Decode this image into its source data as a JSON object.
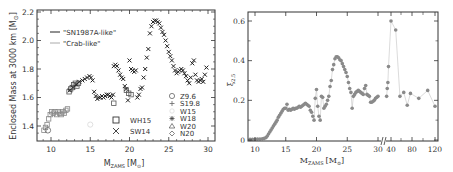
{
  "chart_data": [
    {
      "type": "scatter",
      "title": "",
      "xlabel": "M_ZAMS [M_sun]",
      "ylabel": "Enclosed Mass at 3000 km [M_sun]",
      "xlim": [
        8.3,
        31
      ],
      "ylim": [
        1.3,
        2.22
      ],
      "xticks": [
        10,
        15,
        20,
        25,
        30
      ],
      "yticks": [
        1.4,
        1.6,
        1.8,
        2.0,
        2.2
      ],
      "grid": false,
      "legend_lines": [
        {
          "label": "\"SN1987A-like\"",
          "color": "#222222"
        },
        {
          "label": "\"Crab-like\"",
          "color": "#aaaaaa"
        }
      ],
      "legend_series": [
        {
          "label": "WH15",
          "marker": "square"
        },
        {
          "label": "SW14",
          "marker": "x"
        }
      ],
      "legend_models": [
        {
          "label": "Z9.6",
          "marker": "circle"
        },
        {
          "label": "S19.8",
          "marker": "plus"
        },
        {
          "label": "W15",
          "marker": "light-circle"
        },
        {
          "label": "W18",
          "marker": "asterisk"
        },
        {
          "label": "W20",
          "marker": "triangle"
        },
        {
          "label": "N20",
          "marker": "diamond"
        }
      ],
      "series": [
        {
          "name": "WH15",
          "marker": "square",
          "points": [
            [
              9.1,
              1.37
            ],
            [
              9.3,
              1.39
            ],
            [
              9.5,
              1.41
            ],
            [
              9.7,
              1.45
            ],
            [
              9.9,
              1.48
            ],
            [
              10.1,
              1.5
            ],
            [
              10.3,
              1.49
            ],
            [
              10.5,
              1.5
            ],
            [
              10.7,
              1.48
            ],
            [
              10.9,
              1.5
            ],
            [
              11.1,
              1.49
            ],
            [
              11.3,
              1.48
            ],
            [
              11.5,
              1.5
            ],
            [
              11.7,
              1.49
            ],
            [
              11.9,
              1.51
            ],
            [
              12.1,
              1.52
            ],
            [
              12.3,
              1.64
            ],
            [
              12.5,
              1.66
            ],
            [
              12.7,
              1.67
            ],
            [
              12.9,
              1.69
            ],
            [
              13.1,
              1.7
            ],
            [
              13.3,
              1.68
            ],
            [
              13.5,
              1.7
            ],
            [
              18.0,
              1.56
            ],
            [
              19.6,
              1.65
            ],
            [
              19.9,
              1.63
            ],
            [
              20.2,
              1.62
            ]
          ]
        },
        {
          "name": "SW14",
          "marker": "x",
          "points": [
            [
              12.4,
              1.65
            ],
            [
              12.8,
              1.67
            ],
            [
              13.2,
              1.69
            ],
            [
              13.6,
              1.71
            ],
            [
              14.0,
              1.72
            ],
            [
              14.3,
              1.73
            ],
            [
              14.6,
              1.74
            ],
            [
              14.9,
              1.75
            ],
            [
              15.1,
              1.74
            ],
            [
              15.3,
              1.72
            ],
            [
              15.5,
              1.64
            ],
            [
              15.7,
              1.61
            ],
            [
              15.9,
              1.59
            ],
            [
              16.1,
              1.6
            ],
            [
              16.3,
              1.6
            ],
            [
              16.5,
              1.61
            ],
            [
              16.7,
              1.6
            ],
            [
              16.9,
              1.61
            ],
            [
              17.1,
              1.62
            ],
            [
              17.3,
              1.62
            ],
            [
              17.5,
              1.61
            ],
            [
              17.7,
              1.6
            ],
            [
              17.9,
              1.62
            ],
            [
              18.0,
              1.82
            ],
            [
              18.2,
              1.83
            ],
            [
              18.4,
              1.82
            ],
            [
              18.6,
              1.79
            ],
            [
              18.8,
              1.76
            ],
            [
              19.0,
              1.74
            ],
            [
              19.2,
              1.73
            ],
            [
              19.4,
              1.68
            ],
            [
              19.6,
              1.66
            ],
            [
              19.8,
              1.58
            ],
            [
              20.0,
              1.86
            ],
            [
              20.2,
              1.8
            ],
            [
              20.4,
              1.79
            ],
            [
              20.6,
              1.78
            ],
            [
              20.8,
              1.79
            ],
            [
              21.0,
              1.6
            ],
            [
              21.2,
              1.62
            ],
            [
              21.4,
              1.66
            ],
            [
              21.6,
              1.67
            ],
            [
              21.8,
              1.74
            ],
            [
              22.0,
              1.8
            ],
            [
              22.2,
              1.88
            ],
            [
              22.4,
              1.94
            ],
            [
              22.6,
              2.05
            ],
            [
              22.8,
              2.1
            ],
            [
              23.0,
              2.13
            ],
            [
              23.2,
              2.14
            ],
            [
              23.4,
              2.14
            ],
            [
              23.6,
              2.13
            ],
            [
              23.8,
              2.12
            ],
            [
              24.0,
              2.09
            ],
            [
              24.2,
              2.06
            ],
            [
              24.4,
              2.04
            ],
            [
              24.6,
              2.0
            ],
            [
              24.8,
              1.96
            ],
            [
              25.0,
              1.92
            ],
            [
              25.2,
              1.89
            ],
            [
              25.4,
              1.86
            ],
            [
              25.6,
              1.82
            ],
            [
              25.8,
              1.79
            ],
            [
              26.0,
              1.77
            ],
            [
              26.2,
              1.78
            ],
            [
              26.4,
              1.79
            ],
            [
              26.6,
              1.8
            ],
            [
              26.8,
              1.79
            ],
            [
              27.0,
              1.77
            ],
            [
              27.2,
              1.75
            ],
            [
              27.4,
              1.72
            ],
            [
              27.6,
              1.7
            ],
            [
              27.8,
              1.74
            ],
            [
              28.0,
              1.84
            ],
            [
              28.2,
              1.86
            ],
            [
              28.4,
              1.76
            ],
            [
              28.6,
              1.72
            ],
            [
              28.8,
              1.71
            ],
            [
              29.0,
              1.72
            ],
            [
              29.2,
              1.73
            ],
            [
              29.4,
              1.71
            ],
            [
              29.6,
              1.76
            ],
            [
              29.8,
              1.81
            ]
          ]
        },
        {
          "name": "Z9.6",
          "marker": "circle",
          "points": [
            [
              9.6,
              1.37
            ]
          ]
        },
        {
          "name": "W15",
          "marker": "light-circle",
          "points": [
            [
              15.0,
              1.41
            ]
          ]
        }
      ]
    },
    {
      "type": "scatter",
      "title": "",
      "xlabel": "M_ZAMS [M_sun]",
      "ylabel": "ξ_2.5",
      "ylim": [
        0,
        0.66
      ],
      "xticks": [
        "10",
        "15",
        "20",
        "25",
        "30",
        "40",
        "80",
        "120"
      ],
      "yticks": [
        0,
        0.2,
        0.4,
        0.6
      ],
      "axis_break_after": 30,
      "grid": false,
      "series": [
        {
          "name": "xi_2.5",
          "marker": "filled-circle",
          "color": "#8a8a8a",
          "line_color": "#cccccc",
          "points": [
            [
              9.2,
              0.003
            ],
            [
              9.6,
              0.004
            ],
            [
              10,
              0.004
            ],
            [
              10.4,
              0.005
            ],
            [
              10.8,
              0.005
            ],
            [
              11.2,
              0.006
            ],
            [
              11.5,
              0.008
            ],
            [
              11.8,
              0.012
            ],
            [
              12.0,
              0.02
            ],
            [
              12.2,
              0.03
            ],
            [
              12.4,
              0.04
            ],
            [
              12.6,
              0.05
            ],
            [
              12.8,
              0.06
            ],
            [
              13.0,
              0.07
            ],
            [
              13.2,
              0.08
            ],
            [
              13.4,
              0.09
            ],
            [
              13.6,
              0.1
            ],
            [
              13.8,
              0.115
            ],
            [
              14.0,
              0.125
            ],
            [
              14.2,
              0.135
            ],
            [
              14.4,
              0.145
            ],
            [
              14.6,
              0.155
            ],
            [
              14.8,
              0.16
            ],
            [
              15.0,
              0.16
            ],
            [
              15.2,
              0.18
            ],
            [
              15.4,
              0.15
            ],
            [
              15.6,
              0.155
            ],
            [
              15.8,
              0.15
            ],
            [
              16.0,
              0.155
            ],
            [
              16.2,
              0.16
            ],
            [
              16.4,
              0.155
            ],
            [
              16.6,
              0.16
            ],
            [
              16.8,
              0.16
            ],
            [
              17.0,
              0.165
            ],
            [
              17.2,
              0.17
            ],
            [
              17.4,
              0.165
            ],
            [
              17.6,
              0.17
            ],
            [
              17.8,
              0.175
            ],
            [
              18.0,
              0.18
            ],
            [
              18.2,
              0.185
            ],
            [
              18.4,
              0.18
            ],
            [
              18.6,
              0.175
            ],
            [
              18.8,
              0.17
            ],
            [
              19.0,
              0.15
            ],
            [
              19.2,
              0.14
            ],
            [
              19.4,
              0.12
            ],
            [
              19.6,
              0.1
            ],
            [
              19.8,
              0.21
            ],
            [
              20.0,
              0.255
            ],
            [
              20.2,
              0.17
            ],
            [
              20.4,
              0.12
            ],
            [
              20.6,
              0.1
            ],
            [
              20.8,
              0.22
            ],
            [
              21.0,
              0.215
            ],
            [
              21.2,
              0.16
            ],
            [
              21.4,
              0.17
            ],
            [
              21.6,
              0.18
            ],
            [
              21.8,
              0.2
            ],
            [
              22.0,
              0.22
            ],
            [
              22.2,
              0.27
            ],
            [
              22.4,
              0.3
            ],
            [
              22.6,
              0.355
            ],
            [
              22.8,
              0.38
            ],
            [
              23.0,
              0.41
            ],
            [
              23.2,
              0.42
            ],
            [
              23.4,
              0.42
            ],
            [
              23.6,
              0.415
            ],
            [
              23.8,
              0.405
            ],
            [
              24.0,
              0.4
            ],
            [
              24.2,
              0.385
            ],
            [
              24.4,
              0.37
            ],
            [
              24.6,
              0.355
            ],
            [
              24.8,
              0.34
            ],
            [
              25.0,
              0.32
            ],
            [
              25.2,
              0.29
            ],
            [
              25.4,
              0.26
            ],
            [
              25.6,
              0.24
            ],
            [
              25.8,
              0.16
            ],
            [
              26.0,
              0.22
            ],
            [
              26.2,
              0.23
            ],
            [
              26.4,
              0.24
            ],
            [
              26.6,
              0.245
            ],
            [
              26.8,
              0.25
            ],
            [
              27.0,
              0.245
            ],
            [
              27.2,
              0.24
            ],
            [
              27.4,
              0.235
            ],
            [
              27.6,
              0.23
            ],
            [
              27.8,
              0.26
            ],
            [
              28.0,
              0.275
            ],
            [
              28.2,
              0.23
            ],
            [
              28.4,
              0.225
            ],
            [
              28.6,
              0.22
            ],
            [
              28.8,
              0.19
            ],
            [
              29.0,
              0.19
            ],
            [
              29.2,
              0.195
            ],
            [
              29.4,
              0.2
            ],
            [
              29.6,
              0.21
            ],
            [
              29.8,
              0.215
            ],
            [
              30.0,
              0.22
            ]
          ],
          "points_highmass": [
            [
              33,
              0.22
            ],
            [
              34,
              0.26
            ],
            [
              35,
              0.29
            ],
            [
              36,
              0.37
            ],
            [
              40,
              0.6
            ],
            [
              45,
              0.555
            ],
            [
              50,
              0.22
            ],
            [
              55,
              0.24
            ],
            [
              60,
              0.175
            ],
            [
              65,
              0.235
            ],
            [
              80,
              0.21
            ],
            [
              100,
              0.25
            ],
            [
              120,
              0.17
            ]
          ]
        }
      ]
    }
  ],
  "left_plot": {
    "ylabel": "Enclosed Mass at 3000 km [M",
    "ylabel_sub": "⊙",
    "ylabel_end": "]",
    "xlabel_main": "M",
    "xlabel_sub": "ZAMS",
    "xlabel_unit": "[M",
    "xlabel_unit_sub": "⊙",
    "xlabel_end": "]",
    "xtick_labels": [
      "10",
      "15",
      "20",
      "25",
      "30"
    ],
    "ytick_labels": [
      "1.4",
      "1.6",
      "1.8",
      "2.0",
      "2.2"
    ],
    "legend_line1": "\"SN1987A-like\"",
    "legend_line2": "\"Crab-like\"",
    "legend_wh15": "WH15",
    "legend_sw14": "SW14",
    "legend_models": [
      "Z9.6",
      "S19.8",
      "W15",
      "W18",
      "W20",
      "N20"
    ]
  },
  "right_plot": {
    "ylabel_main": "ξ",
    "ylabel_sub": "2.5",
    "xlabel_main": "M",
    "xlabel_sub": "ZAMS",
    "xlabel_unit": "[M",
    "xlabel_unit_sub": "⊙",
    "xlabel_end": "]",
    "xtick_labels": [
      "10",
      "15",
      "20",
      "25",
      "30",
      "40",
      "80",
      "120"
    ],
    "ytick_labels": [
      "0",
      "0.2",
      "0.4",
      "0.6"
    ]
  },
  "colors": {
    "axis": "#333333",
    "sn1987a_line": "#222222",
    "crab_line": "#aaaaaa",
    "marker_dark": "#333333",
    "marker_gray": "#888888",
    "marker_light": "#dddddd",
    "right_points": "#8a8a8a",
    "right_line": "#cccccc"
  }
}
